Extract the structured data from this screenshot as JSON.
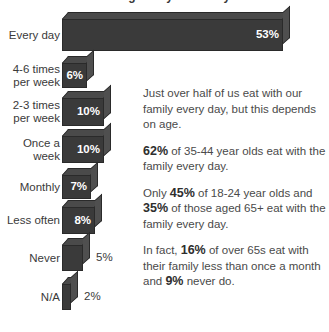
{
  "chart_title": "Eating with your family",
  "chart_data": {
    "type": "bar",
    "orientation": "horizontal",
    "title": "Eating with your family",
    "xlabel": "",
    "ylabel": "",
    "xlim": [
      0,
      53
    ],
    "grid": false,
    "legend": false,
    "value_suffix": "%",
    "categories": [
      "Every day",
      "4-6 times per week",
      "2-3 times per week",
      "Once a week",
      "Monthly",
      "Less often",
      "Never",
      "N/A"
    ],
    "values": [
      53,
      6,
      10,
      10,
      7,
      8,
      5,
      2
    ],
    "bars": [
      {
        "label_line1": "Every day",
        "label_line2": "",
        "value": 53,
        "value_text": "53%",
        "label_position": "inside"
      },
      {
        "label_line1": "4-6 times",
        "label_line2": "per week",
        "value": 6,
        "value_text": "6%",
        "label_position": "inside"
      },
      {
        "label_line1": "2-3 times",
        "label_line2": "per week",
        "value": 10,
        "value_text": "10%",
        "label_position": "inside"
      },
      {
        "label_line1": "Once a",
        "label_line2": "week",
        "value": 10,
        "value_text": "10%",
        "label_position": "inside"
      },
      {
        "label_line1": "Monthly",
        "label_line2": "",
        "value": 7,
        "value_text": "7%",
        "label_position": "inside"
      },
      {
        "label_line1": "Less often",
        "label_line2": "",
        "value": 8,
        "value_text": "8%",
        "label_position": "inside"
      },
      {
        "label_line1": "Never",
        "label_line2": "",
        "value": 5,
        "value_text": "5%",
        "label_position": "outside"
      },
      {
        "label_line1": "N/A",
        "label_line2": "",
        "value": 2,
        "value_text": "2%",
        "label_position": "outside"
      }
    ],
    "colors": {
      "bar_front": "#3a3a3a",
      "bar_top": "#4a4a4a",
      "bar_side": "#4f4f4f",
      "bar_edge": "#2a2a2a",
      "background": "#ffffff",
      "text": "#3a3a3a",
      "value_inside": "#ffffff"
    }
  },
  "commentary": {
    "p1": "Just over half of us eat with our family every day, but this depends on age.",
    "p2_bold": "62%",
    "p2_rest": " of 35-44 year olds eat with the family every day.",
    "p3_pre": "Only ",
    "p3_bold1": "45%",
    "p3_mid": " of 18-24 year olds and ",
    "p3_bold2": "35%",
    "p3_rest": " of those aged 65+ eat with the family every day.",
    "p4_pre": "In fact, ",
    "p4_bold1": "16%",
    "p4_mid": " of over 65s eat with their family less than once a month and ",
    "p4_bold2": "9%",
    "p4_rest": " never do."
  }
}
